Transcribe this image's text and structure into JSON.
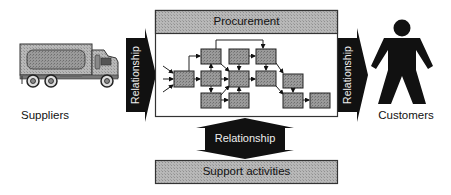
{
  "diagram": {
    "title": "Procurement",
    "suppliers": {
      "label": "Suppliers",
      "icon": "truck-icon"
    },
    "customers": {
      "label": "Customers",
      "icon": "person-icon"
    },
    "left_arrow": {
      "label": "Relationship"
    },
    "right_arrow": {
      "label": "Relationship"
    },
    "bottom_arrow": {
      "label": "Relationship"
    },
    "support": {
      "label": "Support activities"
    },
    "process_flow": {
      "box_count": 12,
      "description": "Network of process steps with inputs on left and output to the right"
    },
    "colors": {
      "arrow_fill": "#111111",
      "box_fill": "#9a9a9a",
      "header_fill": "#b5b5b5",
      "border": "#333333",
      "background": "#ffffff"
    }
  }
}
